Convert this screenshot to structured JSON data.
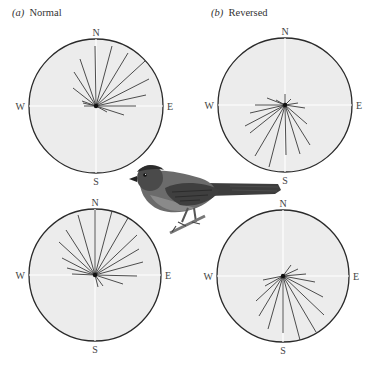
{
  "panels": [
    {
      "letter": "a",
      "title": "Normal",
      "letter_text": "(a)",
      "x": 12,
      "y": 7
    },
    {
      "letter": "b",
      "title": "Reversed",
      "letter_text": "(b)",
      "x": 211,
      "y": 7
    }
  ],
  "compass_labels": {
    "n": "N",
    "s": "S",
    "e": "E",
    "w": "W"
  },
  "colors": {
    "disc_fill": "#ececec",
    "disc_stroke": "#2a2a2a",
    "axis": "#ffffff",
    "vector": "#3a3a3a",
    "label": "#444444"
  },
  "discs": [
    {
      "id": "top-left",
      "panel": "a",
      "cx": 96,
      "cy": 106,
      "r": 67,
      "vectors": [
        [
          95,
          46
        ],
        [
          112,
          46
        ],
        [
          128,
          53
        ],
        [
          145,
          61
        ],
        [
          149,
          79
        ],
        [
          146,
          95
        ],
        [
          136,
          106
        ],
        [
          124,
          115
        ],
        [
          107,
          112
        ],
        [
          80,
          59
        ],
        [
          74,
          72
        ],
        [
          73,
          88
        ],
        [
          82,
          101
        ],
        [
          83,
          103
        ],
        [
          84,
          106
        ]
      ]
    },
    {
      "id": "top-right",
      "panel": "b",
      "cx": 285,
      "cy": 105,
      "r": 67,
      "vectors": [
        [
          285,
          94
        ],
        [
          267,
          98
        ],
        [
          276,
          100
        ],
        [
          255,
          105
        ],
        [
          250,
          113
        ],
        [
          245,
          126
        ],
        [
          250,
          133
        ],
        [
          255,
          156
        ],
        [
          269,
          167
        ],
        [
          286,
          155
        ],
        [
          300,
          154
        ],
        [
          310,
          145
        ],
        [
          307,
          124
        ],
        [
          305,
          108
        ],
        [
          298,
          103
        ],
        [
          291,
          99
        ]
      ]
    },
    {
      "id": "bottom-left",
      "panel": "a",
      "cx": 95,
      "cy": 275,
      "r": 66,
      "vectors": [
        [
          95,
          210
        ],
        [
          78,
          215
        ],
        [
          66,
          230
        ],
        [
          59,
          242
        ],
        [
          62,
          258
        ],
        [
          67,
          268
        ],
        [
          72,
          274
        ],
        [
          112,
          211
        ],
        [
          128,
          218
        ],
        [
          137,
          235
        ],
        [
          139,
          249
        ],
        [
          143,
          262
        ],
        [
          137,
          276
        ],
        [
          123,
          284
        ],
        [
          103,
          286
        ],
        [
          98,
          287
        ]
      ]
    },
    {
      "id": "bottom-right",
      "panel": "b",
      "cx": 283,
      "cy": 276,
      "r": 66,
      "vectors": [
        [
          291,
          265
        ],
        [
          298,
          269
        ],
        [
          306,
          274
        ],
        [
          315,
          282
        ],
        [
          323,
          297
        ],
        [
          324,
          315
        ],
        [
          316,
          332
        ],
        [
          300,
          340
        ],
        [
          283,
          333
        ],
        [
          268,
          329
        ],
        [
          259,
          316
        ],
        [
          256,
          301
        ],
        [
          263,
          280
        ],
        [
          265,
          286
        ]
      ]
    }
  ],
  "bird": {
    "label": "bird-illustration"
  }
}
